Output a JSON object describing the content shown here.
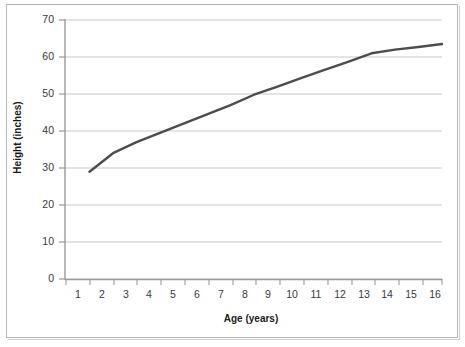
{
  "chart_data": {
    "type": "line",
    "title": "",
    "xlabel": "Age (years)",
    "ylabel": "Height (inches)",
    "xlim": [
      0,
      16
    ],
    "ylim": [
      0,
      70
    ],
    "x_ticks": [
      "1",
      "2",
      "3",
      "4",
      "5",
      "6",
      "7",
      "8",
      "9",
      "10",
      "11",
      "12",
      "13",
      "14",
      "15",
      "16"
    ],
    "y_ticks": [
      "0",
      "10",
      "20",
      "30",
      "40",
      "50",
      "60",
      "70"
    ],
    "grid": "horizontal",
    "legend": "none",
    "series": [
      {
        "name": "Height",
        "color": "#4d4d4d",
        "x": [
          1,
          2,
          3,
          4,
          5,
          6,
          7,
          8,
          9,
          10,
          11,
          12,
          13,
          14,
          15,
          16
        ],
        "values": [
          29.0,
          34.0,
          37.0,
          39.5,
          42.0,
          44.5,
          47.0,
          49.8,
          52.0,
          54.3,
          56.5,
          58.7,
          61.0,
          62.0,
          62.7,
          63.5
        ]
      }
    ]
  },
  "axes": {
    "y_title": "Height (inches)",
    "x_title": "Age (years)"
  },
  "colors": {
    "line": "#4d4d4d",
    "grid": "#c9c9c9",
    "axis": "#9a9a9a",
    "frame": "#b8b8b8",
    "text": "#3a3a3a"
  }
}
